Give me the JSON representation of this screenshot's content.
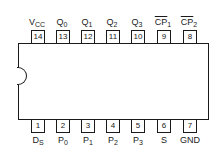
{
  "diagram": {
    "type": "DIP-14 pinout",
    "top_pins": [
      {
        "number": "14",
        "name": "V",
        "sub": "CC",
        "overline": false
      },
      {
        "number": "13",
        "name": "Q",
        "sub": "0",
        "overline": false
      },
      {
        "number": "12",
        "name": "Q",
        "sub": "1",
        "overline": false
      },
      {
        "number": "11",
        "name": "Q",
        "sub": "2",
        "overline": false
      },
      {
        "number": "10",
        "name": "Q",
        "sub": "3",
        "overline": false
      },
      {
        "number": "9",
        "name": "CP",
        "sub": "1",
        "overline": true
      },
      {
        "number": "8",
        "name": "CP",
        "sub": "2",
        "overline": true
      }
    ],
    "bottom_pins": [
      {
        "number": "1",
        "name": "D",
        "sub": "S",
        "overline": false
      },
      {
        "number": "2",
        "name": "P",
        "sub": "0",
        "overline": false
      },
      {
        "number": "3",
        "name": "P",
        "sub": "1",
        "overline": false
      },
      {
        "number": "4",
        "name": "P",
        "sub": "2",
        "overline": false
      },
      {
        "number": "5",
        "name": "P",
        "sub": "3",
        "overline": false
      },
      {
        "number": "6",
        "name": "S",
        "sub": "",
        "overline": false
      },
      {
        "number": "7",
        "name": "GND",
        "sub": "",
        "overline": false
      }
    ]
  }
}
